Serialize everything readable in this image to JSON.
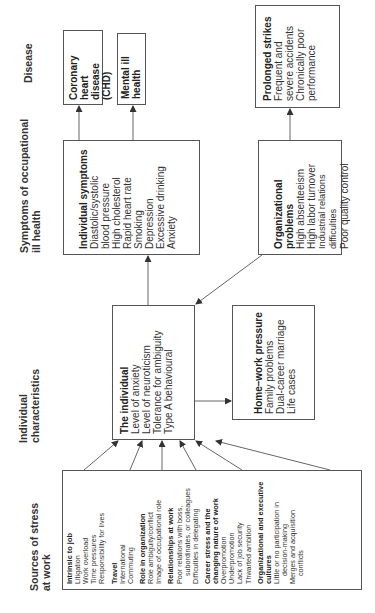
{
  "headers": {
    "sources": [
      "Sources of stress",
      "at work"
    ],
    "individual": [
      "Individual",
      "characteristics"
    ],
    "symptoms": [
      "Symptoms of occupational",
      "ill health"
    ],
    "disease": [
      "Disease"
    ]
  },
  "sources": {
    "groups": [
      {
        "title": "Intrinsic to job",
        "items": [
          "Litigation",
          "Work overload",
          "Time pressures",
          "Responsibility for lives"
        ]
      },
      {
        "title": "Travel",
        "items": [
          "International",
          "Commuting"
        ]
      },
      {
        "title": "Role in organization",
        "items": [
          "Role ambiguity/conflict",
          "Image of occupational role"
        ]
      },
      {
        "title": "Relationships at work",
        "items": [
          "Poor relations with boss,",
          "subordinates, or colleagues",
          "Difficulties in delegating"
        ]
      },
      {
        "title": "Career stress and the changing nature of work",
        "items": [
          "Overpromotion",
          "Underpromotion",
          "Lack of job security",
          "Thwarted ambition"
        ]
      },
      {
        "title": "Organizational and executive cultures",
        "items": [
          "Little or no participation in",
          "decision-making",
          "Merges and acquisition",
          "conflicts"
        ]
      }
    ]
  },
  "individual": {
    "title": "The individual",
    "items": [
      "Level of anxiety",
      "Level of neuroticism",
      "Tolerance for ambiguity",
      "Type A behavioural"
    ]
  },
  "home_work": {
    "title": "Home–work pressure",
    "items": [
      "Family problems",
      "Dual-career marriage",
      "Life cases"
    ]
  },
  "individual_symptoms": {
    "title": "Individual symptoms",
    "items": [
      "Diastolic/systolic",
      "blood pressure",
      "High cholesterol",
      "Rapid heart rate",
      "Smoking",
      "Depression",
      "Excessive drinking",
      "Anxiety"
    ]
  },
  "organizational_problems": {
    "title": "Organizational",
    "title2": "problems",
    "items": [
      "High absenteeism",
      "High labor turnover",
      "Industrial relations difficulties",
      "Poor quality control"
    ]
  },
  "disease": {
    "chd": [
      "Coronary heart",
      "disease (CHD)"
    ],
    "mental": [
      "Mental ill",
      "health"
    ],
    "prolonged": {
      "title": "Prolonged strikes",
      "items": [
        "Frequent and",
        "severe accidents",
        "Chronically poor",
        "performance"
      ]
    }
  },
  "colors": {
    "line": "#555555",
    "text": "#222222"
  }
}
